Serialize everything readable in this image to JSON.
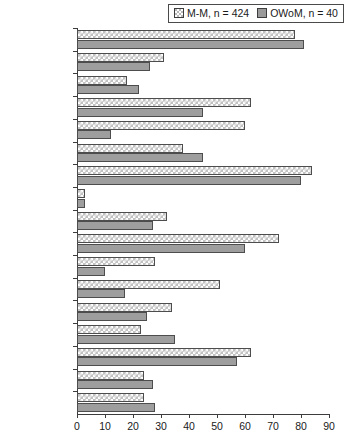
{
  "legend": {
    "series_a_label": "M-M, n = 424",
    "series_b_label": "OWoM, n = 40",
    "position": "top-right"
  },
  "colors": {
    "series_a_fill": "#c2c2c2",
    "series_b_fill": "#9e9e9e",
    "bar_border": "#4d4d4d",
    "axis": "#3c3c3c",
    "background": "#ffffff"
  },
  "axis": {
    "x_ticks": [
      "0",
      "10",
      "20",
      "30",
      "40",
      "50",
      "60",
      "70",
      "80",
      "90"
    ]
  },
  "chart_data": {
    "type": "bar",
    "orientation": "horizontal",
    "title": "",
    "subtitle": "",
    "xlabel": "",
    "ylabel": "",
    "xlim": [
      0,
      90
    ],
    "grid": false,
    "legend_position": "top-right",
    "categories": [
      "Police",
      "Psych.",
      "SocWk",
      "Prison*",
      "Conv.A.Wo*",
      "PhyV.gen",
      "++CrimBeh",
      "SexAb.prevIP",
      "Viol.prev I.Rel.",
      "Break.I.Rel",
      "SexV.notDom*",
      "SexProb/Issues*",
      "MenHeath",
      "DrugAbuse",
      "Alco.Abuse",
      "Employed",
      "Educ/GCSE"
    ],
    "series": [
      {
        "name": "M-M, n = 424",
        "values": [
          78,
          31,
          18,
          62,
          60,
          38,
          84,
          3,
          32,
          72,
          28,
          51,
          34,
          23,
          62,
          24,
          24
        ]
      },
      {
        "name": "OWoM, n = 40",
        "values": [
          81,
          26,
          22,
          45,
          12,
          45,
          80,
          3,
          27,
          60,
          10,
          17,
          25,
          35,
          57,
          27,
          28
        ]
      }
    ]
  }
}
